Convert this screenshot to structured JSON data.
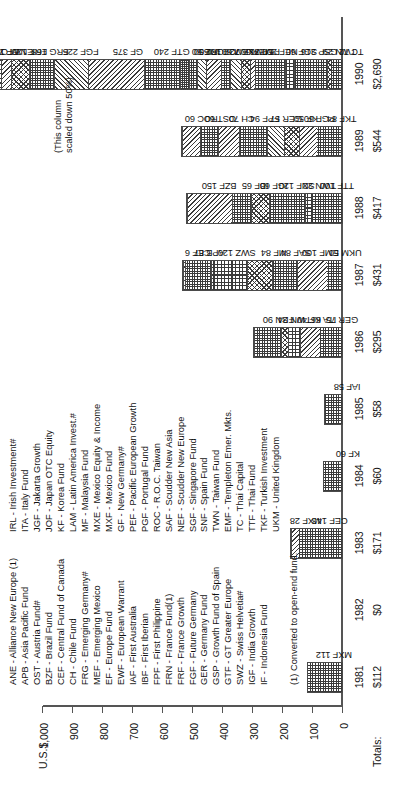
{
  "chart_data": {
    "type": "bar",
    "subtype": "stacked",
    "title": "",
    "xlabel": "",
    "ylabel": "U.S.$",
    "ylim": [
      0,
      1000
    ],
    "yticks": [
      "0",
      "100",
      "200",
      "300",
      "400",
      "500",
      "600",
      "700",
      "800",
      "900",
      "1,000"
    ],
    "grid": false,
    "legend_position": "below-left",
    "categories": [
      "1981",
      "1982",
      "1983",
      "1984",
      "1985",
      "1986",
      "1987",
      "1988",
      "1989",
      "1990"
    ],
    "totals": [
      "$112",
      "$0",
      "$171",
      "$60",
      "$58",
      "$295",
      "$431",
      "$417",
      "$544",
      "$2,690"
    ],
    "totals_label": "Totals:",
    "note": "(This column\nscaled down 50%)",
    "note_applies_to": "1990",
    "footnote": "(1) Converted to open-end fund.",
    "series": [
      {
        "year": "1981",
        "total": 112,
        "segments": [
          {
            "code": "MXF",
            "value": 112,
            "label": "MXF 112",
            "pattern": "p-check"
          }
        ]
      },
      {
        "year": "1982",
        "total": 0,
        "segments": []
      },
      {
        "year": "1983",
        "total": 171,
        "segments": [
          {
            "code": "CEF",
            "value": 143,
            "label": "CEF 143",
            "pattern": "p-check"
          },
          {
            "code": "MXF",
            "value": 28,
            "label": "MXF 28",
            "pattern": "p-diagL"
          }
        ]
      },
      {
        "year": "1984",
        "total": 60,
        "segments": [
          {
            "code": "KF",
            "value": 60,
            "label": "KF 60",
            "pattern": "p-check"
          }
        ]
      },
      {
        "year": "1985",
        "total": 58,
        "segments": [
          {
            "code": "IAF",
            "value": 58,
            "label": "IAF 58",
            "pattern": "p-check"
          }
        ]
      },
      {
        "year": "1986",
        "total": 295,
        "segments": [
          {
            "code": "GER",
            "value": 75,
            "label": "GER 75",
            "pattern": "p-check"
          },
          {
            "code": "ITA",
            "value": 66,
            "label": "ITA 66",
            "pattern": "p-diagL"
          },
          {
            "code": "KF",
            "value": 40,
            "label": "KF 40",
            "pattern": "p-grid"
          },
          {
            "code": "TWN",
            "value": 24,
            "label": "TWN 24",
            "pattern": "p-cross"
          },
          {
            "code": "FRN",
            "value": 90,
            "label": "FRN 90",
            "pattern": "p-check"
          }
        ]
      },
      {
        "year": "1987",
        "total": 431,
        "segments": [
          {
            "code": "UKM",
            "value": 50,
            "label": "UKM 50",
            "pattern": "p-check"
          },
          {
            "code": "EMF",
            "value": 100,
            "label": "EMF 100",
            "pattern": "p-diagL"
          },
          {
            "code": "SAF",
            "value": 84,
            "label": "SAF 84",
            "pattern": "p-check"
          },
          {
            "code": "MF",
            "value": 84,
            "label": "MF 84",
            "pattern": "p-cross"
          },
          {
            "code": "SWZ",
            "value": 120,
            "label": "SWZ 120",
            "pattern": "p-grid"
          },
          {
            "code": "APB",
            "value": 87,
            "label": "APB 87",
            "pattern": "p-check"
          },
          {
            "code": "CEF",
            "value": 6,
            "label": "CEF 6",
            "pattern": "p-diagL"
          }
        ]
      },
      {
        "year": "1988",
        "total": 417,
        "segments": [
          {
            "code": "TTF",
            "value": 100,
            "label": "TTF 100",
            "pattern": "p-check"
          },
          {
            "code": "TWN",
            "value": 22,
            "label": "TWN 22",
            "pattern": "p-grid"
          },
          {
            "code": "SNF",
            "value": 120,
            "label": "SNF 120",
            "pattern": "p-check"
          },
          {
            "code": "IGF",
            "value": 60,
            "label": "IGF 60",
            "pattern": "p-cross"
          },
          {
            "code": "IBF",
            "value": 65,
            "label": "IBF 65",
            "pattern": "p-check"
          },
          {
            "code": "BZF",
            "value": 150,
            "label": "BZF 150",
            "pattern": "p-diagL"
          }
        ]
      },
      {
        "year": "1989",
        "total": 544,
        "segments": [
          {
            "code": "TKF",
            "value": 84,
            "label": "TKF 84",
            "pattern": "p-check"
          },
          {
            "code": "PGF",
            "value": 60,
            "label": "PGF 60",
            "pattern": "p-diagL"
          },
          {
            "code": "KF",
            "value": 50,
            "label": "KF 50",
            "pattern": "p-cross"
          },
          {
            "code": "GER",
            "value": 57,
            "label": "GER 57",
            "pattern": "p-diagR"
          },
          {
            "code": "FPF",
            "value": 94,
            "label": "FPF 94",
            "pattern": "p-check"
          },
          {
            "code": "CH",
            "value": 70,
            "label": "CH 70",
            "pattern": "p-diagL"
          },
          {
            "code": "OST",
            "value": 60,
            "label": "OST 60",
            "pattern": "p-check"
          },
          {
            "code": "ROC",
            "value": 60,
            "label": "ROC 60",
            "pattern": "p-diagL"
          }
        ]
      },
      {
        "year": "1990",
        "total": 2690,
        "scaled_down_pct": 50,
        "segments": [
          {
            "code": "TC",
            "value": 72,
            "label": "TC 72",
            "pattern": "p-check"
          },
          {
            "code": "TWN",
            "value": 29,
            "label": "TWN 29",
            "pattern": "p-cross"
          },
          {
            "code": "GSP",
            "value": 216,
            "label": "GSP 216",
            "pattern": "p-check"
          },
          {
            "code": "SGF",
            "value": 60,
            "label": "SGF 60",
            "pattern": "p-grid"
          },
          {
            "code": "NEF",
            "value": 200,
            "label": "NEF 200",
            "pattern": "p-check"
          },
          {
            "code": "PEF",
            "value": 36,
            "label": "PEF 36",
            "pattern": "p-diagL"
          },
          {
            "code": "MEF",
            "value": 60,
            "label": "MEF 60",
            "pattern": "p-cross"
          },
          {
            "code": "MXE",
            "value": 72,
            "label": "MXE 72",
            "pattern": "p-diagR"
          },
          {
            "code": "LAM",
            "value": 60,
            "label": "LAM 60",
            "pattern": "p-check"
          },
          {
            "code": "JOF",
            "value": 102,
            "label": "JOF 102",
            "pattern": "p-diagL"
          },
          {
            "code": "JGF",
            "value": 60,
            "label": "JGF 60",
            "pattern": "p-diagR"
          },
          {
            "code": "IRL",
            "value": 50,
            "label": "IRL 50",
            "pattern": "p-check"
          },
          {
            "code": "IF",
            "value": 60,
            "label": "IF 60",
            "pattern": "p-dense"
          },
          {
            "code": "GTF",
            "value": 240,
            "label": "GTF 240",
            "pattern": "p-check"
          },
          {
            "code": "GF",
            "value": 375,
            "label": "GF 375",
            "pattern": "p-diagL"
          },
          {
            "code": "FGF",
            "value": 225,
            "label": "FGF 225",
            "pattern": "p-diagR"
          },
          {
            "code": "FRG",
            "value": 168,
            "label": "FRG 168",
            "pattern": "p-check"
          },
          {
            "code": "FRF",
            "value": 120,
            "label": "FRF 120",
            "pattern": "p-cross"
          },
          {
            "code": "ENWF",
            "value": 72,
            "label": "ENWF 72",
            "pattern": "p-diagL"
          },
          {
            "code": "EF",
            "value": 109,
            "label": "EF 109",
            "pattern": "p-diagR"
          },
          {
            "code": "OST",
            "value": 43,
            "label": "OST 43",
            "pattern": "p-check"
          },
          {
            "code": "ANE",
            "value": 252,
            "label": "ANE 252",
            "pattern": "p-diagL"
          }
        ]
      }
    ]
  },
  "legend": {
    "columns": [
      [
        "ANE - Alliance New Europe (1)",
        "APB - Asia Pacific Fund",
        "OST - Austria Fund#",
        "BZF - Brazil Fund",
        "CEF - Central Fund of Canada",
        "CH - Chile Fund",
        "FRG - Emerging Germany#",
        "MEF - Emerging Mexico",
        "EF - Europe Fund",
        "EWF - European Warrant",
        "IAF - First Australia",
        "IBF - First Iberian",
        "FPF - First Philippine",
        "FRN - France Fund(1)",
        "FRF - France Growth",
        "FGF - Future Germany",
        "GER - Germany Fund",
        "GSP - Growth Fund of Spain",
        "GTF - GT Greater Europe",
        "SWZ - Swiss Helvetia#",
        "IGF - India Growth",
        "IF - Indonesia Fund"
      ],
      [
        "IRL - Irish Investment#",
        "ITA - Italy Fund",
        "JGF - Jakarta Growth",
        "JOF - Japan OTC Equity",
        "KF - Korea Fund",
        "LAM - Latin America Invest.#",
        "MF - Malaysia Fund",
        "MXE - Mexico Equity & Income",
        "MXF - Mexico Fund",
        "GF - New Germany#",
        "PEF - Pacific European Growth",
        "PGF - Portugal Fund",
        "ROC - R.O.C. Taiwan",
        "SAF - Scudder New Asia",
        "NEF - Scudder New Europe",
        "SGF - Singapore Fund",
        "SNF - Spain Fund",
        "TWN - Taiwan Fund",
        "EMF - Templeton Emer. Mkts.",
        "TC - Thai Capital",
        "TTF - Thai Fund",
        "TKF - Turkish Investment",
        "UKM - United Kingdom"
      ]
    ]
  }
}
